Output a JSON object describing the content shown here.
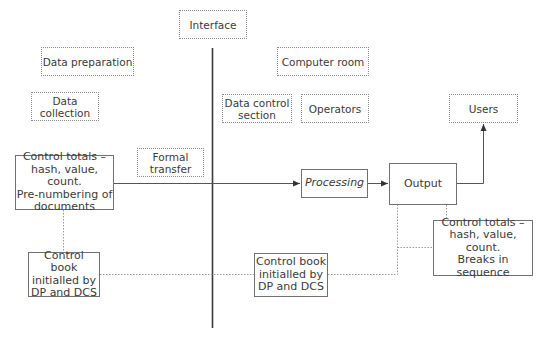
{
  "diagram": {
    "regions": {
      "interface": {
        "label": "Interface"
      },
      "data_preparation": {
        "label": "Data preparation"
      },
      "data_collection": {
        "label": "Data\ncollection"
      },
      "computer_room": {
        "label": "Computer room"
      },
      "data_control_section": {
        "label": "Data control\nsection"
      },
      "operators": {
        "label": "Operators"
      },
      "users": {
        "label": "Users"
      },
      "formal_transfer": {
        "label": "Formal\ntransfer"
      }
    },
    "process_nodes": {
      "control_totals_input": {
        "label": "Control totals –\nhash, value, count.\nPre-numbering of\ndocuments"
      },
      "processing": {
        "label": "Processing"
      },
      "output": {
        "label": "Output"
      },
      "control_totals_output": {
        "label": "Control totals –\nhash, value, count.\nBreaks in\nsequence"
      },
      "control_book_left": {
        "label": "Control book\ninitialled by\nDP and DCS"
      },
      "control_book_right": {
        "label": "Control book\ninitialled by\nDP and DCS"
      }
    },
    "edges": [
      {
        "from": "control_totals_input",
        "to": "processing",
        "style": "solid",
        "arrow": true
      },
      {
        "from": "processing",
        "to": "output",
        "style": "solid",
        "arrow": true
      },
      {
        "from": "output",
        "to": "users",
        "style": "solid",
        "arrow": true
      },
      {
        "from": "control_totals_input",
        "to": "control_book_left",
        "style": "dotted",
        "arrow": false
      },
      {
        "from": "control_book_left",
        "to": "control_book_right",
        "style": "dotted",
        "arrow": false
      },
      {
        "from": "control_book_right",
        "to": "output",
        "style": "dotted",
        "arrow": false
      },
      {
        "from": "output",
        "to": "control_totals_output",
        "style": "dotted",
        "arrow": false
      }
    ],
    "colors": {
      "line": "#444444",
      "dotted_border": "#8a8a8a",
      "text": "#3a3a3a"
    }
  }
}
